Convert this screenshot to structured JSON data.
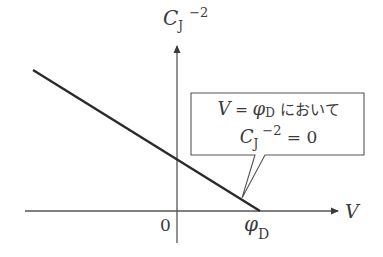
{
  "diagram": {
    "y_axis": {
      "label_main": "C",
      "label_sub": "J",
      "label_sup": "−2"
    },
    "x_axis": {
      "label": "V"
    },
    "origin_label": "0",
    "x_intercept": {
      "label_main": "φ",
      "label_sub": "D"
    },
    "callout": {
      "line1_var": "V",
      "line1_eq": " = ",
      "line1_phi": "φ",
      "line1_phi_sub": "D",
      "line1_text": " において",
      "line2_main": "C",
      "line2_sub": "J",
      "line2_sup": "−2",
      "line2_eq": " = 0"
    },
    "colors": {
      "ink": "#3a3a3a",
      "line": "#2a2a2a",
      "background": "#ffffff"
    }
  }
}
